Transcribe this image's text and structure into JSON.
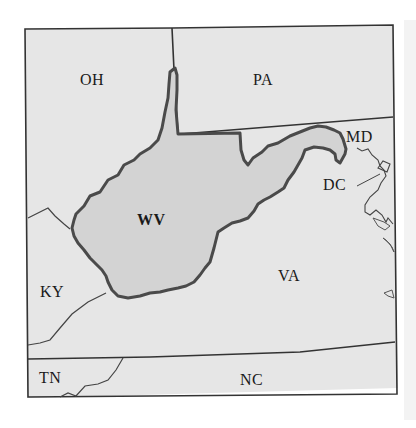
{
  "map": {
    "title": "",
    "colors": {
      "background": "#ffffff",
      "land": "#e6e6e6",
      "highlight_state": "#d4d4d4",
      "border": "#3a3a3a",
      "highlight_border": "#4a4a4a",
      "frame": "#333333"
    },
    "highlighted_state": "WV",
    "labels": {
      "oh": "OH",
      "pa": "PA",
      "md": "MD",
      "dc": "DC",
      "wv": "WV",
      "ky": "KY",
      "va": "VA",
      "tn": "TN",
      "nc": "NC"
    }
  }
}
